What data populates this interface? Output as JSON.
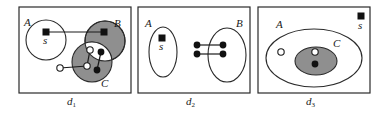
{
  "figure": {
    "panels": [
      {
        "id": "d1",
        "caption": "d",
        "caption_sub": "1",
        "sets": [
          {
            "label": "A",
            "fill": "white",
            "shape": "circle"
          },
          {
            "label": "B",
            "fill": "gray",
            "shape": "circle"
          },
          {
            "label": "C",
            "fill": "gray",
            "shape": "circle",
            "note": "B∩C region is white"
          }
        ],
        "nodes": [
          {
            "type": "square",
            "label": "s",
            "in": "A"
          },
          {
            "type": "square",
            "in": "B"
          },
          {
            "type": "open-circle",
            "in": "B∩C"
          },
          {
            "type": "open-circle",
            "in": "C"
          },
          {
            "type": "open-circle",
            "in": "outside"
          },
          {
            "type": "filled-circle",
            "in": "B∩C"
          },
          {
            "type": "filled-circle",
            "in": "C"
          }
        ],
        "edges": 5
      },
      {
        "id": "d2",
        "caption": "d",
        "caption_sub": "2",
        "sets": [
          {
            "label": "A",
            "fill": "white",
            "shape": "ellipse"
          },
          {
            "label": "B",
            "fill": "white",
            "shape": "ellipse"
          }
        ],
        "nodes": [
          {
            "type": "square",
            "label": "s",
            "in": "A"
          },
          {
            "type": "filled-circle",
            "in": "outside"
          },
          {
            "type": "filled-circle",
            "in": "B"
          },
          {
            "type": "filled-circle",
            "in": "outside"
          },
          {
            "type": "filled-circle",
            "in": "B"
          }
        ],
        "edges": 2
      },
      {
        "id": "d3",
        "caption": "d",
        "caption_sub": "3",
        "sets": [
          {
            "label": "A",
            "fill": "white",
            "shape": "ellipse"
          },
          {
            "label": "C",
            "fill": "gray",
            "shape": "ellipse",
            "inside": "A"
          }
        ],
        "nodes": [
          {
            "type": "square",
            "label": "s",
            "in": "outside"
          },
          {
            "type": "open-circle",
            "in": "A"
          },
          {
            "type": "open-circle",
            "in": "C"
          },
          {
            "type": "filled-circle",
            "in": "C"
          }
        ],
        "edges": 0
      }
    ],
    "labels": {
      "A": "A",
      "B": "B",
      "C": "C",
      "s": "s"
    },
    "colors": {
      "gray_fill": "#8f8f8f",
      "stroke": "#2a2a2a",
      "node": "#111111"
    }
  }
}
